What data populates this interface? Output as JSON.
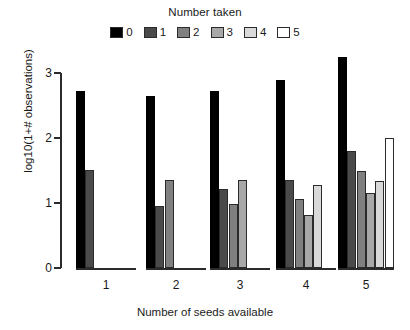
{
  "chart_data": {
    "type": "bar",
    "title": "",
    "legend_title": "Number taken",
    "xlabel": "Number of seeds available",
    "ylabel": "log10(1+# observations)",
    "categories": [
      "1",
      "2",
      "3",
      "4",
      "5"
    ],
    "ylim": [
      0,
      3.4
    ],
    "yticks": [
      0,
      1,
      2,
      3
    ],
    "ytick_labels": [
      "0",
      "1",
      "2",
      "3"
    ],
    "grid": false,
    "legend_position": "top-center",
    "series": [
      {
        "name": "0",
        "color": "#000000",
        "values": [
          2.72,
          2.65,
          2.72,
          2.9,
          3.25
        ]
      },
      {
        "name": "1",
        "color": "#4a4a4a",
        "values": [
          1.51,
          0.95,
          1.22,
          1.36,
          1.8
        ]
      },
      {
        "name": "2",
        "color": "#808080",
        "values": [
          0.0,
          1.35,
          0.98,
          1.06,
          1.5
        ]
      },
      {
        "name": "3",
        "color": "#a8a8a8",
        "values": [
          0.0,
          0.0,
          1.35,
          0.82,
          1.16
        ]
      },
      {
        "name": "4",
        "color": "#d9d9d9",
        "values": [
          0.0,
          0.0,
          0.0,
          1.28,
          1.34
        ]
      },
      {
        "name": "5",
        "color": "#ffffff",
        "values": [
          0.0,
          0.0,
          0.0,
          0.0,
          2.0
        ]
      }
    ]
  }
}
